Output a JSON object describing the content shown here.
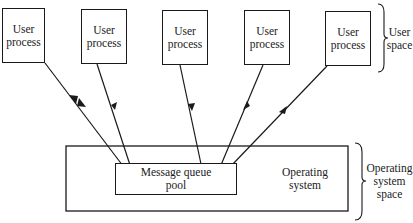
{
  "diagram": {
    "user_processes": [
      {
        "line1": "User",
        "line2": "process",
        "arrow": "both"
      },
      {
        "line1": "User",
        "line2": "process",
        "arrow": "down"
      },
      {
        "line1": "User",
        "line2": "process",
        "arrow": "down"
      },
      {
        "line1": "User",
        "line2": "process",
        "arrow": "up"
      },
      {
        "line1": "User",
        "line2": "process",
        "arrow": "up"
      }
    ],
    "message_queue": {
      "line1": "Message queue",
      "line2": "pool"
    },
    "operating_system": {
      "line1": "Operating",
      "line2": "system"
    },
    "user_space_label": {
      "line1": "User",
      "line2": "space"
    },
    "os_space_label": {
      "line1": "Operating",
      "line2": "system",
      "line3": "space"
    }
  }
}
